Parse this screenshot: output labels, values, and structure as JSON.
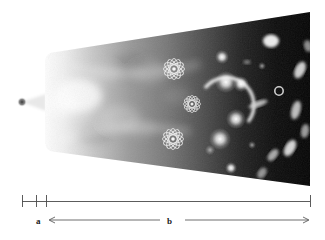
{
  "figure": {
    "type": "scientific-illustration"
  },
  "cone": {
    "origin": {
      "name": "initial-singularity",
      "x": 22,
      "y": 102,
      "dot_color": "#3a3a3a",
      "glow_color": "#ffffff"
    },
    "apex_x": 22,
    "body_start_x": 45,
    "end_x": 310,
    "top_y_at_start": 52,
    "bottom_y_at_start": 152,
    "top_y_at_end": 12,
    "bottom_y_at_end": 186,
    "fill_left_color": "#f2f2f2",
    "fill_mid_color": "#8a8a8a",
    "fill_right_color": "#0a0a0a"
  },
  "atoms": [
    {
      "name": "atom-symbol-upper",
      "cx": 174,
      "cy": 69,
      "r": 11
    },
    {
      "name": "atom-symbol-middle",
      "cx": 192,
      "cy": 104,
      "r": 9
    },
    {
      "name": "atom-symbol-lower",
      "cx": 173,
      "cy": 139,
      "r": 11
    }
  ],
  "objects": [
    {
      "name": "nebula-cloud",
      "cx": 78,
      "cy": 96,
      "rx": 22,
      "ry": 16,
      "brightness": 0.85
    },
    {
      "name": "nebula-cloud",
      "cx": 120,
      "cy": 118,
      "rx": 18,
      "ry": 12,
      "brightness": 0.45
    },
    {
      "name": "nebula-cloud",
      "cx": 150,
      "cy": 72,
      "rx": 16,
      "ry": 11,
      "brightness": 0.35
    },
    {
      "name": "star-bright",
      "cx": 222,
      "cy": 57,
      "r": 4.5,
      "brightness": 1.0
    },
    {
      "name": "star-bright",
      "cx": 226,
      "cy": 82,
      "r": 7,
      "brightness": 1.0
    },
    {
      "name": "star-bright",
      "cx": 241,
      "cy": 84,
      "r": 5,
      "brightness": 0.95
    },
    {
      "name": "star-bright",
      "cx": 236,
      "cy": 119,
      "r": 6,
      "brightness": 1.0
    },
    {
      "name": "star-bright",
      "cx": 220,
      "cy": 139,
      "r": 7,
      "brightness": 1.0
    },
    {
      "name": "star-bright",
      "cx": 231,
      "cy": 168,
      "r": 4,
      "brightness": 0.9
    },
    {
      "name": "galaxy-blob",
      "cx": 271,
      "cy": 41,
      "rx": 7,
      "ry": 6,
      "brightness": 0.9
    },
    {
      "name": "galaxy-ring",
      "cx": 279,
      "cy": 91,
      "r": 4,
      "brightness": 0.7
    },
    {
      "name": "galaxy-elliptical",
      "cx": 258,
      "cy": 104,
      "rx": 9,
      "ry": 3,
      "angle": -20,
      "brightness": 0.8
    },
    {
      "name": "galaxy-elliptical",
      "cx": 300,
      "cy": 70,
      "rx": 5,
      "ry": 8,
      "angle": 25,
      "brightness": 0.85
    },
    {
      "name": "galaxy-elliptical",
      "cx": 296,
      "cy": 110,
      "rx": 4,
      "ry": 9,
      "angle": 15,
      "brightness": 0.8
    },
    {
      "name": "galaxy-elliptical",
      "cx": 290,
      "cy": 148,
      "rx": 5,
      "ry": 9,
      "angle": 30,
      "brightness": 0.9
    },
    {
      "name": "galaxy-elliptical",
      "cx": 273,
      "cy": 155,
      "rx": 4,
      "ry": 7,
      "angle": 40,
      "brightness": 0.75
    },
    {
      "name": "galaxy-elliptical",
      "cx": 305,
      "cy": 131,
      "rx": 4,
      "ry": 7,
      "angle": 10,
      "brightness": 0.7
    },
    {
      "name": "galaxy-elliptical",
      "cx": 262,
      "cy": 173,
      "rx": 4,
      "ry": 6,
      "angle": 35,
      "brightness": 0.7
    },
    {
      "name": "lensing-arc",
      "cx": 228,
      "cy": 108,
      "r": 25,
      "brightness": 0.95
    }
  ],
  "scale": {
    "name": "timeline-scale-bar",
    "axis_start_x": 22,
    "axis_end_x": 310,
    "axis_y": 201,
    "ticks": [
      {
        "name": "tick-origin",
        "x": 22
      },
      {
        "name": "tick-mid",
        "x": 36
      },
      {
        "name": "tick-end-a",
        "x": 46
      },
      {
        "name": "tick-end-b",
        "x": 310
      }
    ],
    "segments": [
      {
        "label": "a",
        "label_x": 36,
        "start_x": 22,
        "end_x": 46,
        "arrow": "none"
      },
      {
        "label": "b",
        "label_x": 167,
        "start_x": 50,
        "end_x": 310,
        "arrow": "both"
      }
    ],
    "arrow_y": 220,
    "line_color": "#4a4a4a"
  }
}
